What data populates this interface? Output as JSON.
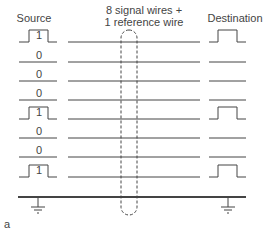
{
  "labels": {
    "source": "Source",
    "destination": "Destination",
    "wires_line1": "8 signal wires +",
    "wires_line2": "1 reference wire",
    "figure": "a"
  },
  "signals": [
    {
      "bit": "1",
      "y": 42
    },
    {
      "bit": "0",
      "y": 62
    },
    {
      "bit": "0",
      "y": 81
    },
    {
      "bit": "0",
      "y": 100
    },
    {
      "bit": "1",
      "y": 119
    },
    {
      "bit": "0",
      "y": 138
    },
    {
      "bit": "0",
      "y": 157
    },
    {
      "bit": "1",
      "y": 177
    }
  ],
  "reference_y": 197,
  "colors": {
    "line": "#444444",
    "text": "#444444"
  }
}
